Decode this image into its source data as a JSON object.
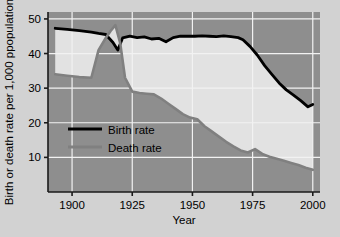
{
  "chart_data": {
    "type": "line",
    "title": "",
    "xlabel": "Year",
    "ylabel": "Birth or death rate per 1,000 ppopulation",
    "xlim": [
      1890,
      2003
    ],
    "ylim": [
      0,
      52
    ],
    "xticks": [
      1900,
      1925,
      1950,
      1975,
      2000
    ],
    "yticks": [
      10,
      20,
      30,
      40,
      50
    ],
    "grid": true,
    "legend_position": "center-left",
    "series": [
      {
        "name": "Birth rate",
        "color": "#000000",
        "x": [
          1893,
          1898,
          1903,
          1908,
          1911,
          1914,
          1917,
          1919,
          1921,
          1924,
          1927,
          1930,
          1933,
          1936,
          1939,
          1942,
          1945,
          1948,
          1951,
          1954,
          1957,
          1960,
          1963,
          1966,
          1969,
          1971,
          1974,
          1977,
          1980,
          1983,
          1986,
          1989,
          1992,
          1995,
          1998,
          2000
        ],
        "values": [
          47.3,
          47.0,
          46.6,
          46.2,
          45.8,
          45.5,
          43.2,
          41.0,
          44.5,
          45.0,
          44.6,
          44.8,
          44.2,
          44.4,
          43.4,
          44.6,
          45.0,
          45.0,
          45.0,
          45.1,
          45.0,
          44.9,
          45.1,
          44.9,
          44.6,
          44.0,
          42.0,
          39.5,
          36.5,
          34.0,
          31.5,
          29.5,
          28.0,
          26.4,
          24.6,
          25.3
        ]
      },
      {
        "name": "Death rate",
        "color": "#808080",
        "x": [
          1893,
          1898,
          1903,
          1908,
          1911,
          1914,
          1916,
          1918,
          1920,
          1922,
          1925,
          1928,
          1931,
          1934,
          1937,
          1940,
          1943,
          1946,
          1949,
          1952,
          1955,
          1958,
          1961,
          1964,
          1967,
          1970,
          1973,
          1976,
          1979,
          1982,
          1985,
          1988,
          1991,
          1994,
          1997,
          2000
        ],
        "values": [
          34.0,
          33.6,
          33.2,
          33.0,
          41.0,
          44.5,
          46.5,
          48.2,
          43.0,
          33.0,
          29.0,
          28.6,
          28.4,
          28.2,
          27.0,
          25.5,
          24.0,
          22.5,
          21.5,
          21.0,
          19.0,
          17.5,
          16.0,
          14.5,
          13.2,
          12.0,
          11.4,
          12.4,
          11.0,
          10.2,
          9.6,
          9.0,
          8.4,
          7.8,
          7.0,
          6.4
        ]
      }
    ]
  },
  "legend": {
    "items": [
      {
        "label": "Birth rate",
        "color": "#000000"
      },
      {
        "label": "Death rate",
        "color": "#808080"
      }
    ]
  },
  "axes": {
    "y_title": "Birth or death rate per 1,000 ppopulation",
    "x_title": "Year",
    "ytick_labels": [
      "50",
      "40",
      "30",
      "20",
      "10"
    ],
    "xtick_labels": [
      "1900",
      "1925",
      "1950",
      "1975",
      "2000"
    ]
  },
  "style": {
    "figure_background": "#d2d2d2",
    "plot_background": "#8e8e8e",
    "band_fill": "#e2e2e2",
    "grid_color": "#f2f2f2",
    "axis_color": "#1a1a1a"
  }
}
